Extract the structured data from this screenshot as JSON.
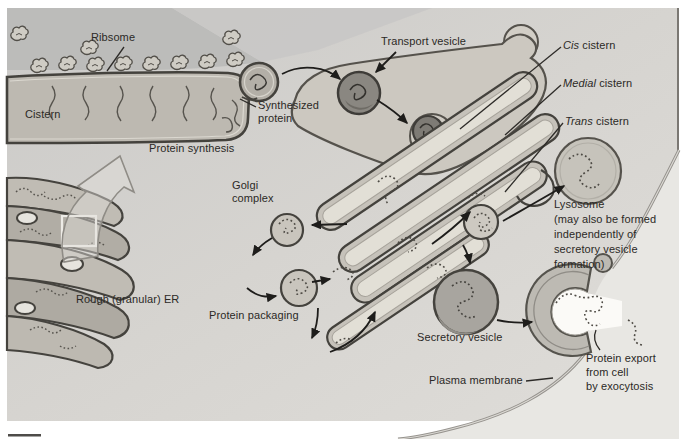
{
  "labels": {
    "ribosome": "Ribsome",
    "cistern": "Cistern",
    "protein_synthesis": "Protein synthesis",
    "synthesized_protein": "Synthesized\nprotein",
    "transport_vesicle": "Transport vesicle",
    "cis_word": "Cis",
    "cis_rest": " cistern",
    "medial_word": "Medial",
    "medial_rest": " cistern",
    "trans_word": "Trans",
    "trans_rest": " cistern",
    "golgi_complex": "Golgi\ncomplex",
    "lysosome_note": "Lysosome\n(may also be formed\nindependently of\nsecretory vesicle\nformation)",
    "rough_er": "Rough (granular) ER",
    "protein_packaging": "Protein packaging",
    "secretory_vesicle": "Secretory vesicle",
    "plasma_membrane": "Plasma membrane",
    "protein_export": "Protein export\nfrom cell\nby exocytosis"
  },
  "colors": {
    "page_background": "#ffffff",
    "cytosol_background": "#d5d3cf",
    "cytosol_dark_corner": "#bcbcba",
    "cell_exterior": "#e8e7e3",
    "membrane_outline": "#45433e",
    "organelle_fill": "#c6c2ba",
    "lumen_fill": "#e2dfd6",
    "dark_vesicle_fill": "#8a8781",
    "light_vesicle_fill": "#c3bfb7",
    "secretory_vesicle_fill": "#a8a59f",
    "arrow_color": "#1e1d1b",
    "label_text": "#2b2926"
  }
}
